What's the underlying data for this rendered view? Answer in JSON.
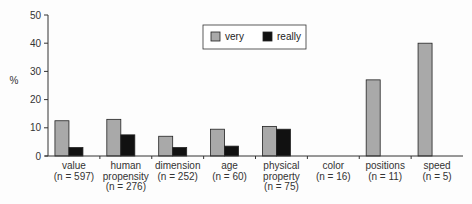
{
  "chart_data": {
    "type": "bar",
    "title": "",
    "xlabel": "",
    "ylabel": "%",
    "ylim": [
      0,
      50
    ],
    "yticks": [
      0,
      10,
      20,
      30,
      40,
      50
    ],
    "grid": false,
    "legend_position": "top-center",
    "categories": [
      [
        "value",
        "(n = 597)"
      ],
      [
        "human",
        "propensity",
        "(n = 276)"
      ],
      [
        "dimension",
        "(n = 252)"
      ],
      [
        "age",
        "(n = 60)"
      ],
      [
        "physical",
        "property",
        "(n = 75)"
      ],
      [
        "color",
        "(n = 16)"
      ],
      [
        "positions",
        "(n = 11)"
      ],
      [
        "speed",
        "(n = 5)"
      ]
    ],
    "series": [
      {
        "name": "very",
        "color": "#a9a9a9",
        "values": [
          12.5,
          13,
          7,
          9.5,
          10.5,
          0,
          27,
          40
        ]
      },
      {
        "name": "really",
        "color": "#111111",
        "values": [
          3,
          7.5,
          3,
          3.5,
          9.5,
          0,
          0,
          0
        ]
      }
    ]
  }
}
